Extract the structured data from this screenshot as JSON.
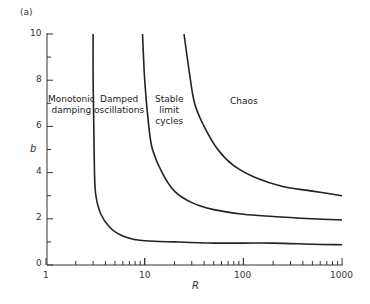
{
  "chart_data": {
    "type": "line",
    "title": "",
    "panel_label": "(a)",
    "xlabel": "R",
    "ylabel": "b",
    "xscale": "log",
    "xlim": [
      1,
      1000
    ],
    "ylim": [
      0,
      10
    ],
    "xticks": [
      "1",
      "10",
      "100",
      "1000"
    ],
    "yticks": [
      "0",
      "2",
      "4",
      "6",
      "8",
      "10"
    ],
    "grid": false,
    "legend": null,
    "series": [
      {
        "name": "Monotonic damping / Damped oscillations boundary",
        "points": [
          [
            3.0,
            10
          ],
          [
            3.0,
            8
          ],
          [
            3.05,
            6
          ],
          [
            3.1,
            4
          ],
          [
            3.2,
            3
          ],
          [
            3.6,
            2.2
          ],
          [
            4.5,
            1.6
          ],
          [
            6,
            1.25
          ],
          [
            8,
            1.1
          ],
          [
            10,
            1.05
          ],
          [
            20,
            1.0
          ],
          [
            50,
            0.95
          ],
          [
            100,
            0.95
          ],
          [
            200,
            0.95
          ],
          [
            500,
            0.9
          ],
          [
            1000,
            0.88
          ]
        ]
      },
      {
        "name": "Damped oscillations / Stable limit cycles boundary",
        "points": [
          [
            9.5,
            10
          ],
          [
            10,
            8
          ],
          [
            11,
            6
          ],
          [
            12,
            5
          ],
          [
            15,
            4
          ],
          [
            20,
            3.2
          ],
          [
            30,
            2.7
          ],
          [
            50,
            2.4
          ],
          [
            100,
            2.2
          ],
          [
            200,
            2.1
          ],
          [
            500,
            2.0
          ],
          [
            1000,
            1.95
          ]
        ]
      },
      {
        "name": "Stable limit cycles / Chaos boundary",
        "points": [
          [
            25,
            10
          ],
          [
            28,
            8.5
          ],
          [
            32,
            7
          ],
          [
            40,
            6
          ],
          [
            55,
            5
          ],
          [
            80,
            4.3
          ],
          [
            130,
            3.8
          ],
          [
            250,
            3.4
          ],
          [
            500,
            3.2
          ],
          [
            1000,
            3.0
          ]
        ]
      }
    ],
    "annotations": [
      {
        "text": "Monotonic\ndamping",
        "x": 1.4,
        "y": 7.3
      },
      {
        "text": "Damped\noscillations",
        "x": 5.5,
        "y": 7.3
      },
      {
        "text": "Stable\nlimit\ncycles",
        "x": 16,
        "y": 7.0
      },
      {
        "text": "Chaos",
        "x": 100,
        "y": 7.3
      }
    ]
  },
  "labels": {
    "panel": "(a)",
    "xlabel": "R",
    "ylabel": "b",
    "region_monotonic_1": "Monotonic",
    "region_monotonic_2": "damping",
    "region_damped_1": "Damped",
    "region_damped_2": "oscillations",
    "region_stable_1": "Stable",
    "region_stable_2": "limit",
    "region_stable_3": "cycles",
    "region_chaos": "Chaos",
    "xtick_1": "1",
    "xtick_10": "10",
    "xtick_100": "100",
    "xtick_1000": "1000",
    "ytick_0": "0",
    "ytick_2": "2",
    "ytick_4": "4",
    "ytick_6": "6",
    "ytick_8": "8",
    "ytick_10": "10"
  }
}
